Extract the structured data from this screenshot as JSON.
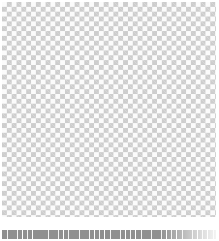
{
  "image": {
    "kind": "checkerboard-texture",
    "width": 219,
    "height": 241,
    "background_color": "#ffffff",
    "alt_text": ""
  },
  "pattern": {
    "name": "checkerboard",
    "cell_size_px": 4.85,
    "period_px": 9.7,
    "columns": 22,
    "rows": 22,
    "light_color": "#fbfbfb",
    "dark_color": "#bdbdbd",
    "opacity": 0.92
  },
  "main_block": {
    "label": "checkerboard-main",
    "x": 2,
    "y": 2,
    "width": 214,
    "height": 215
  },
  "gap_band": {
    "label": "white-separator",
    "y": 217,
    "height": 13,
    "color": "#ffffff"
  },
  "footer_strip": {
    "label": "checkerboard-footer",
    "y": 230,
    "height": 9,
    "dark_color": "#8a8a8a",
    "light_color": "#f2f2f2",
    "description": "compressed clipped final row"
  },
  "margins": {
    "top": 2,
    "left": 2,
    "right": 3,
    "bottom": 2
  }
}
